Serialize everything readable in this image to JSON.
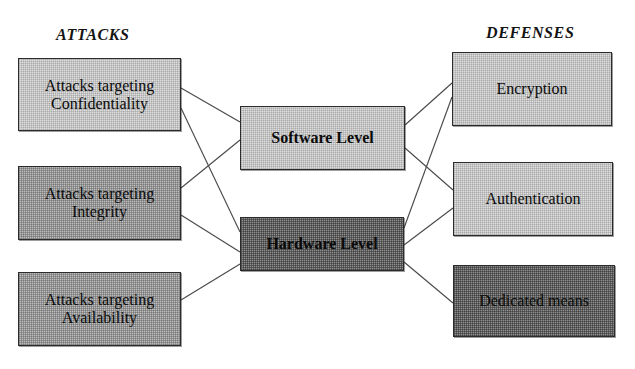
{
  "figure": {
    "headings": {
      "left": "ATTACKS",
      "right": "DEFENSES"
    },
    "attack_nodes": [
      {
        "id": "confidentiality",
        "line1": "Attacks targeting",
        "line2": "Confidentiality",
        "tone": "light"
      },
      {
        "id": "integrity",
        "line1": "Attacks targeting",
        "line2": "Integrity",
        "tone": "medium"
      },
      {
        "id": "availability",
        "line1": "Attacks targeting",
        "line2": "Availability",
        "tone": "medium"
      }
    ],
    "level_nodes": [
      {
        "id": "software",
        "label": "Software Level",
        "tone": "light"
      },
      {
        "id": "hardware",
        "label": "Hardware Level",
        "tone": "dark"
      }
    ],
    "defense_nodes": [
      {
        "id": "encryption",
        "label": "Encryption",
        "tone": "light"
      },
      {
        "id": "authentication",
        "label": "Authentication",
        "tone": "light"
      },
      {
        "id": "dedicated",
        "label": "Dedicated means",
        "tone": "dark"
      }
    ],
    "edges": [
      {
        "from": "confidentiality",
        "to": "software"
      },
      {
        "from": "confidentiality",
        "to": "hardware"
      },
      {
        "from": "integrity",
        "to": "software"
      },
      {
        "from": "integrity",
        "to": "hardware"
      },
      {
        "from": "availability",
        "to": "hardware"
      },
      {
        "from": "software",
        "to": "encryption"
      },
      {
        "from": "software",
        "to": "authentication"
      },
      {
        "from": "hardware",
        "to": "encryption"
      },
      {
        "from": "hardware",
        "to": "authentication"
      },
      {
        "from": "hardware",
        "to": "dedicated"
      }
    ],
    "colors": {
      "tone_light": "#dedede",
      "tone_medium": "#bdbdbd",
      "tone_dark": "#8e8e8e",
      "border": "#2b2b2b",
      "edge": "#4a4a4a",
      "text": "#0a0a0a",
      "background": "#ffffff"
    }
  }
}
